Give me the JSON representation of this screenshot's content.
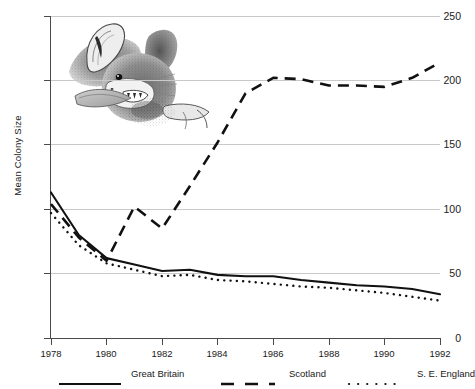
{
  "chart_data": {
    "type": "line",
    "title": "",
    "xlabel": "",
    "ylabel": "Mean Colony Size",
    "x": [
      1978,
      1979,
      1980,
      1981,
      1982,
      1983,
      1984,
      1985,
      1986,
      1987,
      1988,
      1989,
      1990,
      1991,
      1992
    ],
    "xlim": [
      1978,
      1992
    ],
    "ylim": [
      0,
      250
    ],
    "xticks": [
      1978,
      1980,
      1982,
      1984,
      1986,
      1988,
      1990,
      1992
    ],
    "xtick_labels": [
      "1978",
      "1980",
      "1982",
      "1984",
      "1986",
      "1988",
      "1990",
      "1992"
    ],
    "yticks": [
      0,
      50,
      100,
      150,
      200,
      250
    ],
    "ytick_labels": [
      "0",
      "50",
      "100",
      "150",
      "200",
      "250"
    ],
    "grid": true,
    "legend_position": "bottom",
    "series": [
      {
        "name": "Great Britain",
        "style": "solid",
        "color": "#111111",
        "values": [
          113,
          80,
          62,
          57,
          52,
          53,
          49,
          48,
          48,
          45,
          43,
          41,
          40,
          38,
          34
        ]
      },
      {
        "name": "Scotland",
        "style": "dashed",
        "color": "#111111",
        "values": [
          104,
          78,
          60,
          102,
          85,
          118,
          152,
          190,
          202,
          201,
          196,
          196,
          195,
          202,
          214
        ]
      },
      {
        "name": "S. E. England",
        "style": "dotted",
        "color": "#111111",
        "values": [
          97,
          72,
          58,
          53,
          48,
          49,
          45,
          44,
          42,
          40,
          39,
          37,
          35,
          32,
          29
        ]
      }
    ]
  },
  "legend": {
    "items": [
      {
        "label": "Great Britain",
        "style": "solid"
      },
      {
        "label": "Scotland",
        "style": "dashed"
      },
      {
        "label": "S. E. England",
        "style": "dotted"
      }
    ]
  },
  "illustration": {
    "name": "bat-head-engraving",
    "description": "Greyscale stipple engraving of a bat's head"
  }
}
